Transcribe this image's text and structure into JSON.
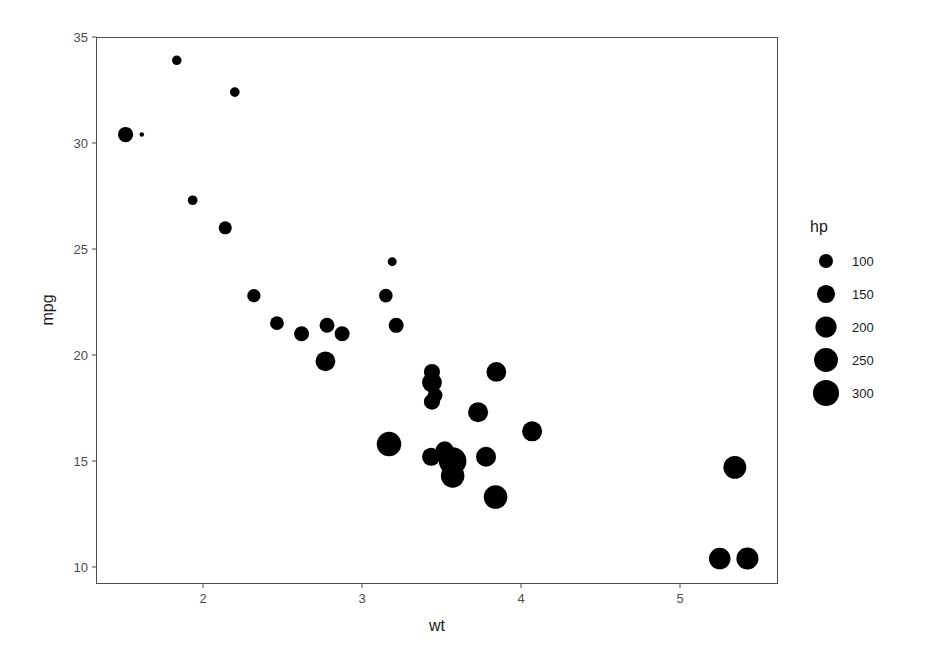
{
  "chart_data": {
    "type": "scatter",
    "title": "",
    "xlabel": "wt",
    "ylabel": "mpg",
    "xlim": [
      1.35,
      5.63
    ],
    "ylim": [
      9.2,
      35.0
    ],
    "x_ticks": [
      2,
      3,
      4,
      5
    ],
    "y_ticks": [
      10,
      15,
      20,
      25,
      30,
      35
    ],
    "grid": false,
    "size_variable": "hp",
    "legend": {
      "title": "hp",
      "position": "right",
      "entries": [
        100,
        150,
        200,
        250,
        300
      ]
    },
    "points": [
      {
        "wt": 2.62,
        "mpg": 21.0,
        "hp": 110
      },
      {
        "wt": 2.875,
        "mpg": 21.0,
        "hp": 110
      },
      {
        "wt": 2.32,
        "mpg": 22.8,
        "hp": 93
      },
      {
        "wt": 3.215,
        "mpg": 21.4,
        "hp": 110
      },
      {
        "wt": 3.44,
        "mpg": 18.7,
        "hp": 175
      },
      {
        "wt": 3.46,
        "mpg": 18.1,
        "hp": 105
      },
      {
        "wt": 3.57,
        "mpg": 14.3,
        "hp": 245
      },
      {
        "wt": 3.19,
        "mpg": 24.4,
        "hp": 62
      },
      {
        "wt": 3.15,
        "mpg": 22.8,
        "hp": 95
      },
      {
        "wt": 3.44,
        "mpg": 19.2,
        "hp": 123
      },
      {
        "wt": 3.44,
        "mpg": 17.8,
        "hp": 123
      },
      {
        "wt": 4.07,
        "mpg": 16.4,
        "hp": 180
      },
      {
        "wt": 3.73,
        "mpg": 17.3,
        "hp": 180
      },
      {
        "wt": 3.78,
        "mpg": 15.2,
        "hp": 180
      },
      {
        "wt": 5.25,
        "mpg": 10.4,
        "hp": 205
      },
      {
        "wt": 5.424,
        "mpg": 10.4,
        "hp": 215
      },
      {
        "wt": 5.345,
        "mpg": 14.7,
        "hp": 230
      },
      {
        "wt": 2.2,
        "mpg": 32.4,
        "hp": 66
      },
      {
        "wt": 1.615,
        "mpg": 30.4,
        "hp": 52
      },
      {
        "wt": 1.835,
        "mpg": 33.9,
        "hp": 65
      },
      {
        "wt": 2.465,
        "mpg": 21.5,
        "hp": 97
      },
      {
        "wt": 3.52,
        "mpg": 15.5,
        "hp": 150
      },
      {
        "wt": 3.435,
        "mpg": 15.2,
        "hp": 150
      },
      {
        "wt": 3.84,
        "mpg": 13.3,
        "hp": 245
      },
      {
        "wt": 3.845,
        "mpg": 19.2,
        "hp": 175
      },
      {
        "wt": 1.935,
        "mpg": 27.3,
        "hp": 66
      },
      {
        "wt": 2.14,
        "mpg": 26.0,
        "hp": 91
      },
      {
        "wt": 1.513,
        "mpg": 30.4,
        "hp": 113
      },
      {
        "wt": 3.17,
        "mpg": 15.8,
        "hp": 264
      },
      {
        "wt": 2.77,
        "mpg": 19.7,
        "hp": 175
      },
      {
        "wt": 3.57,
        "mpg": 15.0,
        "hp": 335
      },
      {
        "wt": 2.78,
        "mpg": 21.4,
        "hp": 109
      }
    ]
  },
  "colors": {
    "point": "#000000",
    "panel_border": "#4d4d4d",
    "tick_text": "#4d4d4d",
    "title_text": "#1a1a1a"
  }
}
